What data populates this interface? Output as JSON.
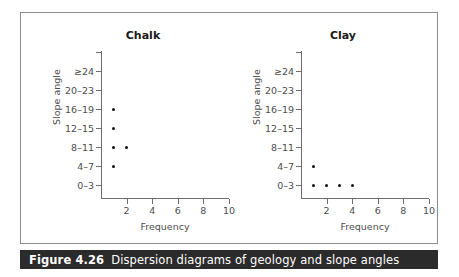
{
  "figure": {
    "caption_number": "Figure 4.26",
    "caption_text": "Dispersion diagrams of geology and slope angles",
    "accent_bar_color": "#2b2b2b",
    "frame_color": "#8c8c8c",
    "dot_color": "#111111",
    "axis_color": "#6e6e6e"
  },
  "chart_data": [
    {
      "type": "scatter",
      "title": "Chalk",
      "xlabel": "Frequency",
      "ylabel": "Slope angle",
      "grid": false,
      "legend": false,
      "xlim": [
        0,
        10
      ],
      "xticks": [
        2,
        4,
        6,
        8,
        10
      ],
      "xticklabels": [
        "2",
        "4",
        "6",
        "8",
        "10"
      ],
      "ycategories": [
        "0–3",
        "4–7",
        "8–11",
        "12–15",
        "16–19",
        "20–23",
        "≥24"
      ],
      "points": [
        {
          "category": "16–19",
          "x": 1
        },
        {
          "category": "12–15",
          "x": 1
        },
        {
          "category": "8–11",
          "x": 1
        },
        {
          "category": "8–11",
          "x": 2
        },
        {
          "category": "4–7",
          "x": 1
        }
      ],
      "counts_by_category": {
        "0–3": 0,
        "4–7": 1,
        "8–11": 2,
        "12–15": 1,
        "16–19": 1,
        "20–23": 0,
        "≥24": 0
      }
    },
    {
      "type": "scatter",
      "title": "Clay",
      "xlabel": "Frequency",
      "ylabel": "Slope angle",
      "grid": false,
      "legend": false,
      "xlim": [
        0,
        10
      ],
      "xticks": [
        2,
        4,
        6,
        8,
        10
      ],
      "xticklabels": [
        "2",
        "4",
        "6",
        "8",
        "10"
      ],
      "ycategories": [
        "0–3",
        "4–7",
        "8–11",
        "12–15",
        "16–19",
        "20–23",
        "≥24"
      ],
      "points": [
        {
          "category": "4–7",
          "x": 1
        },
        {
          "category": "0–3",
          "x": 1
        },
        {
          "category": "0–3",
          "x": 2
        },
        {
          "category": "0–3",
          "x": 3
        },
        {
          "category": "0–3",
          "x": 4
        }
      ],
      "counts_by_category": {
        "0–3": 4,
        "4–7": 1,
        "8–11": 0,
        "12–15": 0,
        "16–19": 0,
        "20–23": 0,
        "≥24": 0
      }
    }
  ]
}
